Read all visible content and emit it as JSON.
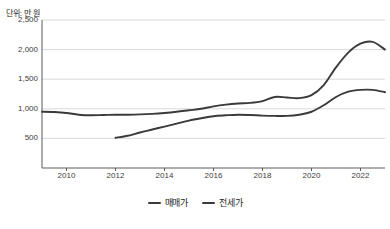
{
  "unit_caption": "단위: 만 원",
  "legend": {
    "position": "bottom-center",
    "items": [
      {
        "label": "매매가",
        "color": "#3a3a3a",
        "icon": "line-swatch-icon"
      },
      {
        "label": "전세가",
        "color": "#3a3a3a",
        "icon": "line-swatch-icon"
      }
    ]
  },
  "axes": {
    "y_ticks": [
      "500",
      "1,000",
      "1,500",
      "2,000",
      "2,500"
    ],
    "x_ticks": [
      "2010",
      "2012",
      "2014",
      "2016",
      "2018",
      "2020",
      "2022"
    ]
  },
  "colors": {
    "line_sale": "#3a3a3a",
    "line_jeonse": "#3a3a3a",
    "grid": "#d9d9d9",
    "axis": "#5a5a5a",
    "background": "#ffffff",
    "text": "#3c3c3c"
  },
  "chart_data": {
    "type": "line",
    "title": "",
    "subtitle": "",
    "xlabel": "",
    "ylabel": "",
    "unit": "단위: 만 원",
    "xlim": [
      2009,
      2023
    ],
    "ylim": [
      0,
      2500
    ],
    "yticks": [
      500,
      1000,
      1500,
      2000,
      2500
    ],
    "xticks": [
      2010,
      2012,
      2014,
      2016,
      2018,
      2020,
      2022
    ],
    "grid": true,
    "legend_position": "bottom-center",
    "series": [
      {
        "name": "매매가",
        "color": "#3a3a3a",
        "x": [
          2009.0,
          2009.5,
          2010.0,
          2010.5,
          2011.0,
          2011.5,
          2012.0,
          2012.5,
          2013.0,
          2013.5,
          2014.0,
          2014.5,
          2015.0,
          2015.5,
          2016.0,
          2016.5,
          2017.0,
          2017.5,
          2018.0,
          2018.5,
          2019.0,
          2019.5,
          2020.0,
          2020.5,
          2021.0,
          2021.5,
          2022.0,
          2022.5,
          2023.0
        ],
        "values": [
          950,
          945,
          930,
          900,
          890,
          895,
          900,
          900,
          905,
          915,
          930,
          950,
          975,
          1000,
          1040,
          1070,
          1090,
          1100,
          1130,
          1200,
          1190,
          1180,
          1230,
          1400,
          1700,
          1950,
          2100,
          2130,
          2000
        ]
      },
      {
        "name": "전세가",
        "color": "#3a3a3a",
        "x": [
          2012.0,
          2012.5,
          2013.0,
          2013.5,
          2014.0,
          2014.5,
          2015.0,
          2015.5,
          2016.0,
          2016.5,
          2017.0,
          2017.5,
          2018.0,
          2018.5,
          2019.0,
          2019.5,
          2020.0,
          2020.5,
          2021.0,
          2021.5,
          2022.0,
          2022.5,
          2023.0
        ],
        "values": [
          510,
          545,
          600,
          650,
          700,
          750,
          800,
          840,
          875,
          890,
          900,
          895,
          885,
          880,
          880,
          900,
          950,
          1060,
          1200,
          1290,
          1320,
          1320,
          1280
        ]
      }
    ]
  }
}
